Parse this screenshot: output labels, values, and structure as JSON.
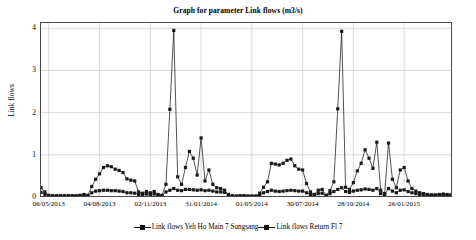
{
  "chart_data": {
    "type": "line",
    "title": "Graph for parameter Link flows (m3/s)",
    "xlabel": "",
    "ylabel": "Link flows",
    "ylim": [
      0,
      4.15
    ],
    "yticks": [
      0,
      1,
      2,
      3,
      4
    ],
    "ytick_labels": [
      "0",
      "1",
      "2",
      "3",
      "4"
    ],
    "grid": true,
    "legend_position": "bottom",
    "xtick_labels": [
      "06/05/2013",
      "04/08/2013",
      "02/11/2013",
      "31/01/2014",
      "01/05/2014",
      "30/07/2014",
      "28/10/2014",
      "26/01/2015"
    ],
    "xtick_index": [
      2,
      15,
      28,
      41,
      54,
      67,
      80,
      93
    ],
    "n_points": 106,
    "series": [
      {
        "name": "Link flows Yeh Ho Main 7 Sungsang",
        "color": "#1a1a1a",
        "marker": "square",
        "values": [
          0.22,
          0.12,
          0.04,
          0.03,
          0.03,
          0.03,
          0.03,
          0.03,
          0.03,
          0.03,
          0.04,
          0.06,
          0.04,
          0.25,
          0.42,
          0.55,
          0.7,
          0.74,
          0.72,
          0.66,
          0.63,
          0.58,
          0.43,
          0.4,
          0.38,
          0.12,
          0.09,
          0.13,
          0.1,
          0.13,
          0.06,
          0.04,
          0.3,
          2.08,
          3.95,
          0.48,
          0.3,
          0.7,
          1.08,
          0.92,
          0.52,
          1.4,
          0.38,
          0.64,
          0.3,
          0.22,
          0.2,
          0.16,
          0.06,
          0.03,
          0.02,
          0.03,
          0.03,
          0.02,
          0.02,
          0.02,
          0.09,
          0.23,
          0.36,
          0.8,
          0.78,
          0.76,
          0.8,
          0.87,
          0.9,
          0.74,
          0.66,
          0.64,
          0.32,
          0.12,
          0.06,
          0.16,
          0.18,
          0.04,
          0.15,
          0.36,
          2.09,
          3.93,
          0.23,
          0.18,
          0.34,
          0.62,
          0.8,
          1.12,
          0.92,
          0.68,
          1.3,
          0.16,
          0.08,
          1.28,
          0.42,
          0.22,
          0.64,
          0.7,
          0.38,
          0.2,
          0.14,
          0.1,
          0.08,
          0.06,
          0.05,
          0.05,
          0.06,
          0.07,
          0.06,
          0.05
        ]
      },
      {
        "name": "Link flows Return Fl 7",
        "color": "#1a1a1a",
        "marker": "square",
        "values": [
          0.11,
          0.06,
          0.02,
          0.02,
          0.02,
          0.02,
          0.02,
          0.02,
          0.02,
          0.02,
          0.02,
          0.03,
          0.02,
          0.1,
          0.14,
          0.15,
          0.16,
          0.16,
          0.15,
          0.15,
          0.14,
          0.13,
          0.1,
          0.1,
          0.09,
          0.06,
          0.05,
          0.07,
          0.06,
          0.07,
          0.04,
          0.03,
          0.12,
          0.16,
          0.2,
          0.16,
          0.15,
          0.18,
          0.18,
          0.17,
          0.16,
          0.17,
          0.15,
          0.16,
          0.14,
          0.12,
          0.12,
          0.11,
          0.05,
          0.02,
          0.02,
          0.02,
          0.02,
          0.02,
          0.02,
          0.02,
          0.05,
          0.1,
          0.13,
          0.16,
          0.14,
          0.13,
          0.14,
          0.15,
          0.16,
          0.15,
          0.14,
          0.14,
          0.1,
          0.06,
          0.04,
          0.08,
          0.09,
          0.03,
          0.08,
          0.13,
          0.18,
          0.22,
          0.13,
          0.11,
          0.14,
          0.16,
          0.17,
          0.19,
          0.18,
          0.16,
          0.2,
          0.08,
          0.05,
          0.2,
          0.14,
          0.1,
          0.16,
          0.17,
          0.13,
          0.1,
          0.08,
          0.06,
          0.05,
          0.04,
          0.04,
          0.04,
          0.04,
          0.05,
          0.04,
          0.04
        ]
      }
    ]
  },
  "legend": [
    {
      "label": "Link flows Yeh Ho Main 7 Sungsang"
    },
    {
      "label": "Link flows Return Fl 7"
    }
  ]
}
